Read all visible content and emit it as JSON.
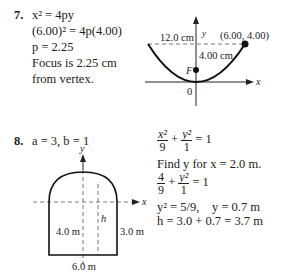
{
  "problem7": {
    "number": "7.",
    "lines": [
      "x² = 4py",
      "(6.00)² = 4p(4.00)",
      "p = 2.25",
      "Focus is 2.25 cm",
      "from vertex."
    ],
    "diagram": {
      "y_axis_label": "y",
      "x_axis_label": "x",
      "width_label": "12.0 cm",
      "point_label": "(6.00, 4.00)",
      "height_label": "4.00 cm",
      "focus_label": "F",
      "origin_label": "0"
    }
  },
  "problem8": {
    "number": "8.",
    "given": "a = 3, b = 1",
    "diagram": {
      "y_axis_label": "y",
      "x_axis_label": "x",
      "left_height_label": "4.0 m",
      "h_label": "h",
      "right_height_label": "3.0 m",
      "base_label": "6.0 m"
    },
    "solution": {
      "eq1": {
        "x_num": "x²",
        "x_den": "9",
        "y_num": "y²",
        "y_den": "1",
        "rhs": "= 1"
      },
      "find": "Find y for x = 2.0 m.",
      "eq2": {
        "x_num": "4",
        "x_den": "9",
        "y_num": "y²",
        "y_den": "1",
        "rhs": "= 1"
      },
      "eq3_left": "y² = 5/9,",
      "eq3_right": "y = 0.7 m",
      "eq4": "h = 3.0 + 0.7 = 3.7 m"
    }
  }
}
